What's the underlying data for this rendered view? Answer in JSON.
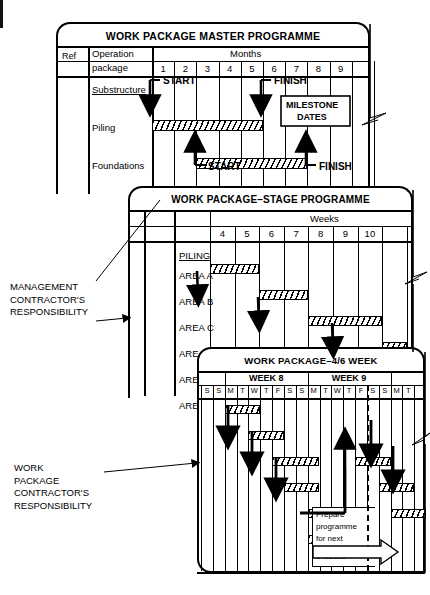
{
  "panel1": {
    "title": "WORK PACKAGE MASTER PROGRAMME",
    "col_ref": "Ref",
    "col_op_line1": "Operation",
    "col_op_line2": "package",
    "timescale_label": "Months",
    "ticks": [
      "1",
      "2",
      "3",
      "4",
      "5",
      "6",
      "7",
      "8",
      "9"
    ],
    "rows": [
      {
        "name": "Substructure",
        "underline": true
      },
      {
        "name": "Piling",
        "underline": false
      },
      {
        "name": "Foundations",
        "underline": false
      }
    ],
    "bars": [
      {
        "row": "Piling",
        "start_tick": 1,
        "end_tick": 6
      },
      {
        "row": "Foundations",
        "start_tick": 3,
        "end_tick": 8
      }
    ],
    "markers": [
      {
        "label": "START",
        "row": "Substructure",
        "dir": "down",
        "at_tick": 1
      },
      {
        "label": "FINISH",
        "row": "Substructure",
        "dir": "down",
        "at_tick": 6
      },
      {
        "label": "START",
        "row": "Foundations",
        "dir": "up",
        "at_tick": 3
      },
      {
        "label": "FINISH",
        "row": "Foundations",
        "dir": "up",
        "at_tick": 8
      }
    ],
    "callout_line1": "MILESTONE",
    "callout_line2": "DATES"
  },
  "panel2": {
    "title": "WORK PACKAGE–STAGE PROGRAMME",
    "timescale_label": "Weeks",
    "ticks": [
      "4",
      "5",
      "6",
      "7",
      "8",
      "9",
      "10"
    ],
    "group_label": "PILING",
    "rows": [
      "AREA A",
      "AREA B",
      "AREA C",
      "AREA D",
      "AREA E",
      "AREA F"
    ],
    "bars": [
      {
        "row": "AREA A",
        "start_tick": 0,
        "end_tick": 2
      },
      {
        "row": "AREA B",
        "start_tick": 2,
        "end_tick": 4
      },
      {
        "row": "AREA C",
        "start_tick": 4,
        "end_tick": 7
      },
      {
        "row": "AREA D",
        "start_tick": 7,
        "end_tick": 8
      }
    ]
  },
  "panel3": {
    "title": "WORK PACKAGE–4/6 WEEK",
    "weeks": [
      "WEEK 8",
      "WEEK 9"
    ],
    "days": [
      "S",
      "S",
      "M",
      "T",
      "W",
      "T",
      "F",
      "S",
      "S",
      "M",
      "T",
      "W",
      "T",
      "F",
      "S",
      "S",
      "M",
      "T"
    ],
    "bars": [
      {
        "row": 0,
        "start_day": 2,
        "end_day": 5
      },
      {
        "row": 1,
        "start_day": 4,
        "end_day": 7
      },
      {
        "row": 2,
        "start_day": 6,
        "end_day": 10
      },
      {
        "row": 2,
        "start_day": 13,
        "end_day": 16
      },
      {
        "row": 3,
        "start_day": 7,
        "end_day": 10
      },
      {
        "row": 3,
        "start_day": 15,
        "end_day": 18
      },
      {
        "row": 4,
        "start_day": 9,
        "end_day": 12
      },
      {
        "row": 4,
        "start_day": 16,
        "end_day": 19
      },
      {
        "row": 5,
        "start_day": 9,
        "end_day": 12
      }
    ],
    "note_line1": "Prepare",
    "note_line2": "programme",
    "note_line3": "for next",
    "note_line4": "6 weeks"
  },
  "captions": {
    "management": "MANAGEMENT\nCONTRACTOR'S\nRESPONSIBILITY",
    "contractor": "WORK\nPACKAGE\nCONTRACTOR'S\nRESPONSIBILITY"
  },
  "colors": {
    "ink": "#000000",
    "paper": "#ffffff"
  }
}
